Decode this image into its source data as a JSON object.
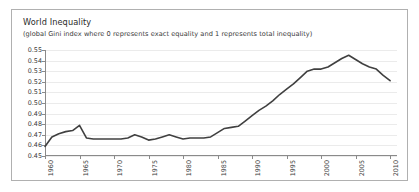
{
  "figure": {
    "title": "World Inequality",
    "subtitle": "(global Gini index where 0 represents exact equality and 1 represents total inequality)",
    "border_color": "#b0b0b0",
    "background_color": "#ffffff"
  },
  "chart_data": {
    "type": "line",
    "title": "World Inequality",
    "subtitle": "(global Gini index where 0 represents exact equality and 1 represents total inequality)",
    "xlabel": "",
    "ylabel": "",
    "xlim": [
      1960,
      2011
    ],
    "ylim": [
      0.45,
      0.55
    ],
    "grid": true,
    "legend": "none",
    "line_color": "#404040",
    "line_width": 1.6,
    "ytick_labels": [
      "0.55",
      "0.54",
      "0.53",
      "0.52",
      "0.51",
      "0.50",
      "0.49",
      "0.48",
      "0.47",
      "0.46",
      "0.45"
    ],
    "ytick_values": [
      0.55,
      0.54,
      0.53,
      0.52,
      0.51,
      0.5,
      0.49,
      0.48,
      0.47,
      0.46,
      0.45
    ],
    "xtick_labels": [
      "1960",
      "1965",
      "1970",
      "1975",
      "1980",
      "1985",
      "1990",
      "1995",
      "2000",
      "2005",
      "2010"
    ],
    "xtick_values": [
      1960,
      1965,
      1970,
      1975,
      1980,
      1985,
      1990,
      1995,
      2000,
      2005,
      2010
    ],
    "series": [
      {
        "name": "Global Gini index",
        "x": [
          1960,
          1961,
          1962,
          1963,
          1964,
          1965,
          1966,
          1967,
          1968,
          1969,
          1970,
          1971,
          1972,
          1973,
          1974,
          1975,
          1976,
          1977,
          1978,
          1979,
          1980,
          1981,
          1982,
          1983,
          1984,
          1985,
          1986,
          1987,
          1988,
          1989,
          1990,
          1991,
          1992,
          1993,
          1994,
          1995,
          1996,
          1997,
          1998,
          1999,
          2000,
          2001,
          2002,
          2003,
          2004,
          2005,
          2006,
          2007,
          2008,
          2009,
          2010
        ],
        "values": [
          0.459,
          0.468,
          0.471,
          0.473,
          0.474,
          0.479,
          0.467,
          0.466,
          0.466,
          0.466,
          0.466,
          0.466,
          0.467,
          0.47,
          0.468,
          0.465,
          0.466,
          0.468,
          0.47,
          0.468,
          0.466,
          0.467,
          0.467,
          0.467,
          0.468,
          0.472,
          0.476,
          0.477,
          0.478,
          0.483,
          0.488,
          0.493,
          0.497,
          0.502,
          0.508,
          0.513,
          0.518,
          0.524,
          0.53,
          0.532,
          0.532,
          0.534,
          0.538,
          0.542,
          0.545,
          0.541,
          0.537,
          0.534,
          0.532,
          0.526,
          0.521
        ]
      }
    ]
  }
}
